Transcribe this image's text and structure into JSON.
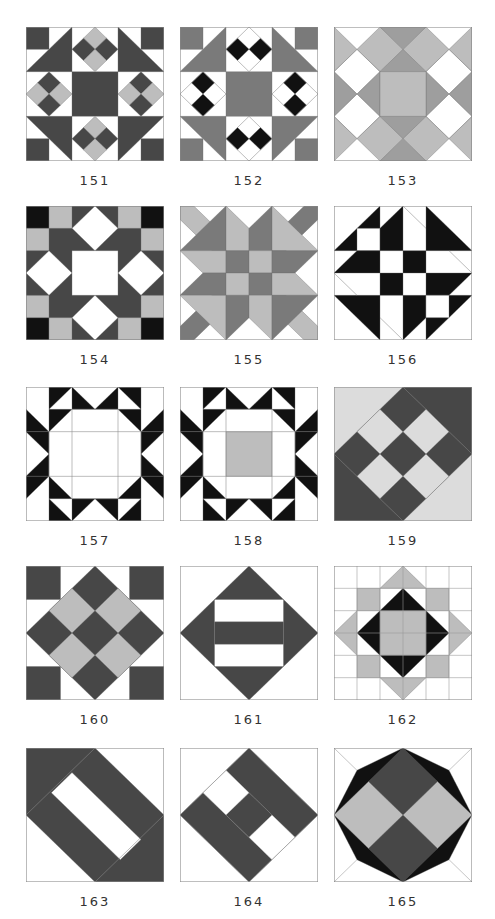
{
  "page": {
    "colors": {
      "white": "#ffffff",
      "dark": "#474747",
      "black": "#111111",
      "mid": "#7a7a7a",
      "gray": "#9e9e9e",
      "light": "#bdbdbd",
      "pale": "#dcdcdc",
      "outline": "#8a8a8a"
    }
  },
  "blocks": [
    {
      "number": "151",
      "name": "block-151",
      "bg": "white",
      "shapes": [
        {
          "c": "dark",
          "p": "0,0 1,0 1,1 0,1"
        },
        {
          "c": "dark",
          "p": "5,0 6,0 6,1 5,1"
        },
        {
          "c": "dark",
          "p": "0,6 1,6 1,5 0,5"
        },
        {
          "c": "dark",
          "p": "5,6 6,6 6,5 5,5"
        },
        {
          "c": "dark",
          "p": "0,2 2,0 2,2"
        },
        {
          "c": "dark",
          "p": "4,0 6,2 4,2"
        },
        {
          "c": "dark",
          "p": "0,4 2,4 2,6"
        },
        {
          "c": "dark",
          "p": "4,4 6,4 4,6"
        },
        {
          "c": "dark",
          "p": "2,2 4,2 4,4 2,4"
        },
        {
          "c": "light",
          "p": "3,0 3.5,0.5 3,1 2.5,0.5"
        },
        {
          "c": "dark",
          "p": "2.5,0.5 3,1 2.5,1.5 2,1"
        },
        {
          "c": "dark",
          "p": "3.5,0.5 4,1 3.5,1.5 3,1"
        },
        {
          "c": "light",
          "p": "3,1 3.5,1.5 3,2 2.5,1.5"
        },
        {
          "c": "light",
          "p": "3,4 3.5,4.5 3,5 2.5,4.5"
        },
        {
          "c": "dark",
          "p": "2.5,4.5 3,5 2.5,5.5 2,5"
        },
        {
          "c": "dark",
          "p": "3.5,4.5 4,5 3.5,5.5 3,5"
        },
        {
          "c": "light",
          "p": "3,5 3.5,5.5 3,6 2.5,5.5"
        },
        {
          "c": "dark",
          "p": "1,2 1.5,2.5 1,3 0.5,2.5"
        },
        {
          "c": "light",
          "p": "0.5,2.5 1,3 0.5,3.5 0,3"
        },
        {
          "c": "light",
          "p": "1.5,2.5 2,3 1.5,3.5 1,3"
        },
        {
          "c": "dark",
          "p": "1,3 1.5,3.5 1,4 0.5,3.5"
        },
        {
          "c": "dark",
          "p": "5,2 5.5,2.5 5,3 4.5,2.5"
        },
        {
          "c": "light",
          "p": "4.5,2.5 5,3 4.5,3.5 4,3"
        },
        {
          "c": "light",
          "p": "5.5,2.5 6,3 5.5,3.5 5,3"
        },
        {
          "c": "dark",
          "p": "5,3 5.5,3.5 5,4 4.5,3.5"
        }
      ]
    },
    {
      "number": "152",
      "name": "block-152",
      "bg": "white",
      "shapes": [
        {
          "c": "mid",
          "p": "0,0 1,0 1,1 0,1"
        },
        {
          "c": "mid",
          "p": "5,0 6,0 6,1 5,1"
        },
        {
          "c": "mid",
          "p": "0,6 1,6 1,5 0,5"
        },
        {
          "c": "mid",
          "p": "5,6 6,6 6,5 5,5"
        },
        {
          "c": "mid",
          "p": "0,2 2,0 2,2"
        },
        {
          "c": "mid",
          "p": "4,0 6,2 4,2"
        },
        {
          "c": "mid",
          "p": "0,4 2,4 2,6"
        },
        {
          "c": "mid",
          "p": "4,4 6,4 4,6"
        },
        {
          "c": "mid",
          "p": "2,2 4,2 4,4 2,4"
        },
        {
          "c": "black",
          "p": "2.5,0.5 3,1 2.5,1.5 2,1"
        },
        {
          "c": "black",
          "p": "3.5,0.5 4,1 3.5,1.5 3,1"
        },
        {
          "c": "black",
          "p": "2.5,4.5 3,5 2.5,5.5 2,5"
        },
        {
          "c": "black",
          "p": "3.5,4.5 4,5 3.5,5.5 3,5"
        },
        {
          "c": "black",
          "p": "1,2 1.5,2.5 1,3 0.5,2.5"
        },
        {
          "c": "black",
          "p": "1,3 1.5,3.5 1,4 0.5,3.5"
        },
        {
          "c": "black",
          "p": "5,2 5.5,2.5 5,3 4.5,2.5"
        },
        {
          "c": "black",
          "p": "5,3 5.5,3.5 5,4 4.5,3.5"
        },
        {
          "c": "none",
          "p": "3,0 4,1 3,2 2,1"
        },
        {
          "c": "none",
          "p": "3,4 4,5 3,6 2,5"
        },
        {
          "c": "none",
          "p": "1,2 2,3 1,4 0,3"
        },
        {
          "c": "none",
          "p": "5,2 6,3 5,4 4,3"
        }
      ]
    },
    {
      "number": "153",
      "name": "block-153",
      "bg": "white",
      "shapes": [
        {
          "c": "light",
          "p": "0,0 1,1 0,2"
        },
        {
          "c": "light",
          "p": "6,0 5,1 6,2"
        },
        {
          "c": "light",
          "p": "0,6 1,5 0,4"
        },
        {
          "c": "light",
          "p": "6,6 5,5 6,4"
        },
        {
          "c": "light",
          "p": "1,1 2,0 3,1 2,2"
        },
        {
          "c": "light",
          "p": "3,1 4,0 5,1 4,2"
        },
        {
          "c": "light",
          "p": "1,5 2,4 3,5 2,6"
        },
        {
          "c": "light",
          "p": "3,5 4,4 5,5 4,6"
        },
        {
          "c": "gray",
          "p": "2,0 4,0 3,1"
        },
        {
          "c": "gray",
          "p": "2,6 4,6 3,5"
        },
        {
          "c": "gray",
          "p": "0,2 1,3 0,4"
        },
        {
          "c": "gray",
          "p": "6,2 5,3 6,4"
        },
        {
          "c": "gray",
          "p": "3,1 4,2 2,2"
        },
        {
          "c": "gray",
          "p": "3,5 4,4 2,4"
        },
        {
          "c": "gray",
          "p": "1,3 2,2 2,4"
        },
        {
          "c": "gray",
          "p": "5,3 4,2 4,4"
        },
        {
          "c": "light",
          "p": "2,2 4,2 4,4 2,4"
        },
        {
          "c": "none",
          "p": "0,2 1,1 2,2 1,3"
        },
        {
          "c": "none",
          "p": "6,2 5,1 4,2 5,3"
        },
        {
          "c": "none",
          "p": "0,4 1,5 2,4 1,3"
        },
        {
          "c": "none",
          "p": "6,4 5,5 4,4 5,3"
        }
      ]
    },
    {
      "number": "154",
      "name": "block-154",
      "bg": "dark",
      "shapes": [
        {
          "c": "black",
          "p": "0,0 1,0 1,1 0,1"
        },
        {
          "c": "black",
          "p": "5,0 6,0 6,1 5,1"
        },
        {
          "c": "black",
          "p": "0,5 1,5 1,6 0,6"
        },
        {
          "c": "black",
          "p": "5,5 6,5 6,6 5,6"
        },
        {
          "c": "light",
          "p": "1,0 2,0 2,1 1,1"
        },
        {
          "c": "light",
          "p": "4,0 5,0 5,1 4,1"
        },
        {
          "c": "light",
          "p": "0,1 1,1 1,2 0,2"
        },
        {
          "c": "light",
          "p": "5,1 6,1 6,2 5,2"
        },
        {
          "c": "light",
          "p": "1,5 2,5 2,6 1,6"
        },
        {
          "c": "light",
          "p": "4,5 5,5 5,6 4,6"
        },
        {
          "c": "light",
          "p": "0,4 1,4 1,5 0,5"
        },
        {
          "c": "light",
          "p": "5,4 6,4 6,5 5,5"
        },
        {
          "c": "white",
          "p": "2,2 4,2 4,4 2,4"
        },
        {
          "c": "white",
          "p": "3,0 4,1 3,2 2,1"
        },
        {
          "c": "white",
          "p": "3,4 4,5 3,6 2,5"
        },
        {
          "c": "white",
          "p": "1,2 2,3 1,4 0,3"
        },
        {
          "c": "white",
          "p": "5,2 6,3 5,4 4,3"
        }
      ]
    },
    {
      "number": "155",
      "name": "block-155",
      "bg": "white",
      "shapes": [
        {
          "c": "light",
          "p": "0,0 0.6,0 2,1.4 2,2 1.4,2 0,0.6"
        },
        {
          "c": "mid",
          "p": "6,0 5.4,0 4,1.4 4,2 4.6,2 6,0.6"
        },
        {
          "c": "mid",
          "p": "0,6 0.6,6 2,4.6 2,4 1.4,4 0,5.4"
        },
        {
          "c": "light",
          "p": "6,6 5.4,6 4,4.6 4,4 4.6,4 6,5.4"
        },
        {
          "c": "mid",
          "p": "0,2 2,0 2,2"
        },
        {
          "c": "light",
          "p": "2,0 3,1 3,2 2,2"
        },
        {
          "c": "mid",
          "p": "4,0 3,1 3,2 4,2"
        },
        {
          "c": "light",
          "p": "4,0 6,2 4,2"
        },
        {
          "c": "light",
          "p": "0,2 2,2 2,3 1,3"
        },
        {
          "c": "mid",
          "p": "2,2 3,2 3,3 2,3"
        },
        {
          "c": "light",
          "p": "3,2 4,2 4,3 3,3"
        },
        {
          "c": "mid",
          "p": "4,2 6,2 5,3 4,3"
        },
        {
          "c": "mid",
          "p": "1,3 2,3 2,4 0,4"
        },
        {
          "c": "light",
          "p": "2,3 3,3 3,4 2,4"
        },
        {
          "c": "mid",
          "p": "3,3 4,3 4,4 3,4"
        },
        {
          "c": "light",
          "p": "4,3 5,3 6,4 4,4"
        },
        {
          "c": "light",
          "p": "0,4 2,4 2,6"
        },
        {
          "c": "mid",
          "p": "2,4 3,4 3,5 2,6"
        },
        {
          "c": "light",
          "p": "3,4 4,4 4,6 3,5"
        },
        {
          "c": "mid",
          "p": "4,4 6,4 4,6"
        }
      ]
    },
    {
      "number": "156",
      "name": "block-156",
      "bg": "white",
      "shapes": [
        {
          "c": "black",
          "p": "0,2 2,0 2,2"
        },
        {
          "c": "white",
          "p": "1,1 2,1 2,2 1,2"
        },
        {
          "c": "black",
          "p": "2,1 3,0 3,2 2,2"
        },
        {
          "c": "black",
          "p": "4,0 6,2 4,2"
        },
        {
          "c": "black",
          "p": "0,3 1,2 2,2 2,3"
        },
        {
          "c": "black",
          "p": "3,2 4,2 4,3 3,3"
        },
        {
          "c": "black",
          "p": "2,3 3,3 3,4 2,4"
        },
        {
          "c": "black",
          "p": "4,3 6,3 5,4 4,4"
        },
        {
          "c": "black",
          "p": "0,4 2,4 2,6"
        },
        {
          "c": "black",
          "p": "3,4 4,4 4,5 3,6"
        },
        {
          "c": "black",
          "p": "4,6 6,4 4,4"
        },
        {
          "c": "white",
          "p": "4,4 5,4 5,5 4,5"
        },
        {
          "c": "none",
          "p": "3,0 4,1"
        },
        {
          "c": "none",
          "p": "5,2 6,3"
        },
        {
          "c": "none",
          "p": "0,3 1,4"
        },
        {
          "c": "none",
          "p": "2,5 3,6"
        }
      ]
    },
    {
      "number": "157",
      "name": "block-157",
      "bg": "white",
      "shapes": [
        {
          "c": "black",
          "p": "1,0 2,0 1,1"
        },
        {
          "c": "black",
          "p": "2,0 3,1 2,1"
        },
        {
          "c": "black",
          "p": "3,1 4,0 4,1"
        },
        {
          "c": "black",
          "p": "4,0 5,0 5,1"
        },
        {
          "c": "black",
          "p": "1,6 2,6 1,5"
        },
        {
          "c": "black",
          "p": "2,6 3,5 2,5"
        },
        {
          "c": "black",
          "p": "3,5 4,6 4,5"
        },
        {
          "c": "black",
          "p": "4,6 5,6 5,5"
        },
        {
          "c": "black",
          "p": "0,1 1,2 0,2"
        },
        {
          "c": "black",
          "p": "0,2 1,3 1,2"
        },
        {
          "c": "black",
          "p": "1,3 0,4 1,4"
        },
        {
          "c": "black",
          "p": "0,4 0,5 1,4"
        },
        {
          "c": "black",
          "p": "6,1 5,2 6,2"
        },
        {
          "c": "black",
          "p": "6,2 5,3 5,2"
        },
        {
          "c": "black",
          "p": "5,3 6,4 5,4"
        },
        {
          "c": "black",
          "p": "6,4 6,5 5,4"
        },
        {
          "c": "black",
          "p": "1,1 2,1 1,2"
        },
        {
          "c": "black",
          "p": "5,1 4,1 5,2"
        },
        {
          "c": "black",
          "p": "1,5 2,5 1,4"
        },
        {
          "c": "black",
          "p": "5,5 4,5 5,4"
        },
        {
          "c": "none",
          "p": "2,1 4,1 4,5 2,5"
        },
        {
          "c": "none",
          "p": "1,2 5,2 5,4 1,4"
        }
      ]
    },
    {
      "number": "158",
      "name": "block-158",
      "bg": "white",
      "shapes": [
        {
          "c": "black",
          "p": "1,0 2,0 1,1"
        },
        {
          "c": "black",
          "p": "2,0 3,1 2,1"
        },
        {
          "c": "black",
          "p": "3,1 4,0 4,1"
        },
        {
          "c": "black",
          "p": "4,0 5,0 5,1"
        },
        {
          "c": "black",
          "p": "1,6 2,6 1,5"
        },
        {
          "c": "black",
          "p": "2,6 3,5 2,5"
        },
        {
          "c": "black",
          "p": "3,5 4,6 4,5"
        },
        {
          "c": "black",
          "p": "4,6 5,6 5,5"
        },
        {
          "c": "black",
          "p": "0,1 1,2 0,2"
        },
        {
          "c": "black",
          "p": "0,2 1,3 1,2"
        },
        {
          "c": "black",
          "p": "1,3 0,4 1,4"
        },
        {
          "c": "black",
          "p": "0,4 0,5 1,4"
        },
        {
          "c": "black",
          "p": "6,1 5,2 6,2"
        },
        {
          "c": "black",
          "p": "6,2 5,3 5,2"
        },
        {
          "c": "black",
          "p": "5,3 6,4 5,4"
        },
        {
          "c": "black",
          "p": "6,4 6,5 5,4"
        },
        {
          "c": "black",
          "p": "1,1 2,1 1,2"
        },
        {
          "c": "black",
          "p": "5,1 4,1 5,2"
        },
        {
          "c": "black",
          "p": "1,5 2,5 1,4"
        },
        {
          "c": "black",
          "p": "5,5 4,5 5,4"
        },
        {
          "c": "light",
          "p": "2,2 4,2 4,4 2,4"
        },
        {
          "c": "none",
          "p": "2,1 4,1 4,5 2,5"
        },
        {
          "c": "none",
          "p": "1,2 5,2 5,4 1,4"
        }
      ]
    },
    {
      "number": "159",
      "name": "block-159",
      "bg": "pale",
      "shapes": [
        {
          "c": "dark",
          "p": "3,0 6,0 6,3"
        },
        {
          "c": "dark",
          "p": "0,3 0,6 3,6"
        },
        {
          "c": "dark",
          "p": "3,0 6,3 3,6 0,3"
        },
        {
          "c": "pale",
          "p": "2,1 3,2 2,3 1,2"
        },
        {
          "c": "pale",
          "p": "4,1 5,2 4,3 3,2"
        },
        {
          "c": "pale",
          "p": "2,3 3,4 2,5 1,4"
        },
        {
          "c": "pale",
          "p": "4,3 5,4 4,5 3,4"
        }
      ]
    },
    {
      "number": "160",
      "name": "block-160",
      "bg": "white",
      "shapes": [
        {
          "c": "dark",
          "p": "0,0 1.5,0 1.5,1.5 0,1.5"
        },
        {
          "c": "dark",
          "p": "4.5,0 6,0 6,1.5 4.5,1.5"
        },
        {
          "c": "dark",
          "p": "0,4.5 1.5,4.5 1.5,6 0,6"
        },
        {
          "c": "dark",
          "p": "4.5,4.5 6,4.5 6,6 4.5,6"
        },
        {
          "c": "dark",
          "p": "3,0 6,3 3,6 0,3"
        },
        {
          "c": "light",
          "p": "2,1 3,2 2,3 1,2"
        },
        {
          "c": "light",
          "p": "4,1 5,2 4,3 3,2"
        },
        {
          "c": "light",
          "p": "2,3 3,4 2,5 1,4"
        },
        {
          "c": "light",
          "p": "4,3 5,4 4,5 3,4"
        }
      ]
    },
    {
      "number": "161",
      "name": "block-161",
      "bg": "white",
      "shapes": [
        {
          "c": "dark",
          "p": "3,0 6,3 3,6 0,3"
        },
        {
          "c": "white",
          "p": "1.5,1.5 4.5,1.5 4.5,2.5 1.5,2.5"
        },
        {
          "c": "white",
          "p": "1.5,3.5 4.5,3.5 4.5,4.5 1.5,4.5"
        },
        {
          "c": "none",
          "p": "1.5,1.5 4.5,1.5 4.5,4.5 1.5,4.5"
        }
      ]
    },
    {
      "number": "162",
      "name": "block-162",
      "bg": "white",
      "shapes": [
        {
          "c": "light",
          "p": "3,0 4,1 2,1"
        },
        {
          "c": "light",
          "p": "3,6 4,5 2,5"
        },
        {
          "c": "light",
          "p": "0,3 1,2 1,4"
        },
        {
          "c": "light",
          "p": "6,3 5,2 5,4"
        },
        {
          "c": "light",
          "p": "1,1 2,1 2,2 1,2"
        },
        {
          "c": "light",
          "p": "4,1 5,1 5,2 4,2"
        },
        {
          "c": "light",
          "p": "1,4 2,4 2,5 1,5"
        },
        {
          "c": "light",
          "p": "4,4 5,4 5,5 4,5"
        },
        {
          "c": "black",
          "p": "3,1 5,3 3,5 1,3"
        },
        {
          "c": "light",
          "p": "2,2 4,2 4,4 2,4"
        },
        {
          "c": "grid",
          "p": "1,0 1,6"
        },
        {
          "c": "grid",
          "p": "2,0 2,6"
        },
        {
          "c": "grid",
          "p": "3,0 3,6"
        },
        {
          "c": "grid",
          "p": "4,0 4,6"
        },
        {
          "c": "grid",
          "p": "5,0 5,6"
        },
        {
          "c": "grid",
          "p": "0,1 6,1"
        },
        {
          "c": "grid",
          "p": "0,2 6,2"
        },
        {
          "c": "grid",
          "p": "0,3 6,3"
        },
        {
          "c": "grid",
          "p": "0,4 6,4"
        },
        {
          "c": "grid",
          "p": "0,5 6,5"
        }
      ]
    },
    {
      "number": "163",
      "name": "block-163",
      "bg": "white",
      "shapes": [
        {
          "c": "dark",
          "p": "0,0 3,0 6,3 6,6 3,6 0,3"
        },
        {
          "c": "white",
          "p": "1.1,2 2,1.1 5,4.1 4.1,5"
        },
        {
          "c": "none",
          "p": "0,3 3,0"
        },
        {
          "c": "none",
          "p": "3,6 6,3"
        }
      ]
    },
    {
      "number": "164",
      "name": "block-164",
      "bg": "white",
      "shapes": [
        {
          "c": "dark",
          "p": "3,0 6,3 5,4 2,1"
        },
        {
          "c": "dark",
          "p": "1,2 4,5 3,6 0,3"
        },
        {
          "c": "dark",
          "p": "3,2 4,3 3,4 2,3"
        },
        {
          "c": "white",
          "p": "2,1 3,2 2,3 1,2"
        },
        {
          "c": "white",
          "p": "4,3 5,4 4,5 3,4"
        },
        {
          "c": "none",
          "p": "3,0 6,3 3,6 0,3"
        }
      ]
    },
    {
      "number": "165",
      "name": "block-165",
      "bg": "white",
      "shapes": [
        {
          "c": "black",
          "p": "3,0 5,1 6,3 5,5 3,6 1,5 0,3 1,1"
        },
        {
          "c": "dark",
          "p": "3,0 4.5,1.5 3,3 1.5,1.5"
        },
        {
          "c": "dark",
          "p": "3,3 4.5,4.5 3,6 1.5,4.5"
        },
        {
          "c": "light",
          "p": "1.5,1.5 3,3 1.5,4.5 0,3"
        },
        {
          "c": "light",
          "p": "4.5,1.5 6,3 4.5,4.5 3,3"
        },
        {
          "c": "grid",
          "p": "0,0 1,1"
        },
        {
          "c": "grid",
          "p": "6,0 5,1"
        },
        {
          "c": "grid",
          "p": "0,6 1,5"
        },
        {
          "c": "grid",
          "p": "6,6 5,5"
        }
      ]
    }
  ]
}
